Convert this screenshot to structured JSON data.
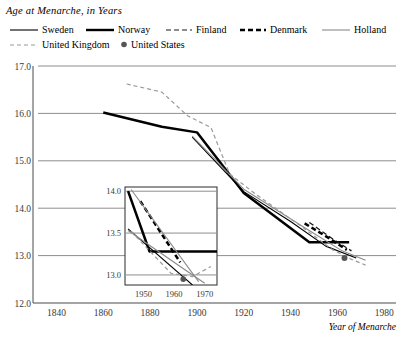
{
  "title": "Age at Menarche, in Years",
  "axis_label_x": "Year of Menarche",
  "legend": {
    "items": [
      {
        "label": "Sweden",
        "style": "thin-solid-black",
        "color": "#000000",
        "icon": "line-swatch-icon"
      },
      {
        "label": "Norway",
        "style": "thick-solid-black",
        "color": "#000000",
        "icon": "line-swatch-icon"
      },
      {
        "label": "Finland",
        "style": "thin-dashed-black",
        "color": "#1a1a1a",
        "icon": "dashed-line-swatch-icon"
      },
      {
        "label": "Denmark",
        "style": "thick-dashed-black",
        "color": "#000000",
        "icon": "dashed-line-swatch-icon"
      },
      {
        "label": "Holland",
        "style": "thin-solid-gray",
        "color": "#8a8a8a",
        "icon": "line-swatch-icon"
      },
      {
        "label": "United Kingdom",
        "style": "thin-dashed-gray",
        "color": "#9a9a9a",
        "icon": "dashed-line-swatch-icon"
      },
      {
        "label": "United States",
        "style": "dot-marker",
        "color": "#555555",
        "icon": "dot-marker-icon"
      }
    ]
  },
  "chart_data": {
    "type": "line",
    "title": "Age at Menarche, in Years",
    "xlabel": "Year of Menarche",
    "ylabel": "",
    "xlim": [
      1830,
      1985
    ],
    "ylim": [
      12.0,
      17.0
    ],
    "xticks": [
      1840,
      1860,
      1880,
      1900,
      1920,
      1940,
      1960,
      1980
    ],
    "yticks": [
      "17.0",
      "16.0",
      "15.0",
      "14.0",
      "13.0",
      "12.0"
    ],
    "grid": "horizontal",
    "legend_position": "top",
    "series": [
      {
        "name": "Norway",
        "style": "thick-solid-black",
        "color": "#000000",
        "points": [
          [
            1860,
            16.02
          ],
          [
            1885,
            15.72
          ],
          [
            1900,
            15.6
          ],
          [
            1920,
            14.32
          ],
          [
            1948,
            13.28
          ],
          [
            1965,
            13.28
          ]
        ]
      },
      {
        "name": "Sweden",
        "style": "thin-solid-black",
        "color": "#000000",
        "points": [
          [
            1898,
            15.5
          ],
          [
            1920,
            14.35
          ],
          [
            1940,
            13.72
          ],
          [
            1955,
            13.2
          ],
          [
            1968,
            12.95
          ]
        ]
      },
      {
        "name": "Holland",
        "style": "thin-solid-gray",
        "color": "#8a8a8a",
        "points": [
          [
            1898,
            15.52
          ],
          [
            1920,
            14.4
          ],
          [
            1945,
            13.62
          ],
          [
            1962,
            13.1
          ],
          [
            1972,
            12.9
          ]
        ]
      },
      {
        "name": "United Kingdom",
        "style": "thin-dashed-gray",
        "color": "#9a9a9a",
        "points": [
          [
            1870,
            16.62
          ],
          [
            1885,
            16.45
          ],
          [
            1896,
            15.95
          ],
          [
            1906,
            15.7
          ],
          [
            1914,
            14.72
          ],
          [
            1925,
            14.3
          ],
          [
            1945,
            13.6
          ],
          [
            1958,
            13.12
          ],
          [
            1966,
            12.92
          ],
          [
            1972,
            12.8
          ]
        ]
      },
      {
        "name": "Finland",
        "style": "thin-dashed-black",
        "color": "#1a1a1a",
        "points": [
          [
            1948,
            13.7
          ],
          [
            1958,
            13.35
          ],
          [
            1966,
            13.1
          ]
        ]
      },
      {
        "name": "Denmark",
        "style": "thick-dashed-black",
        "color": "#000000",
        "points": [
          [
            1946,
            13.68
          ],
          [
            1956,
            13.38
          ],
          [
            1964,
            13.12
          ]
        ]
      },
      {
        "name": "United States",
        "style": "dot-marker",
        "color": "#555555",
        "points": [
          [
            1963,
            12.95
          ]
        ]
      }
    ],
    "inset": {
      "xlim": [
        1944,
        1974
      ],
      "ylim": [
        12.88,
        14.05
      ],
      "xticks": [
        1950,
        1960,
        1970
      ],
      "yticks": [
        "14.0",
        "13.5",
        "13.0"
      ],
      "grid": "horizontal",
      "series": [
        {
          "name": "Norway",
          "style": "thick-solid-black",
          "color": "#000000",
          "points": [
            [
              1945,
              14.0
            ],
            [
              1952,
              13.28
            ],
            [
              1974,
              13.28
            ]
          ]
        },
        {
          "name": "Sweden",
          "style": "thin-solid-black",
          "color": "#000000",
          "points": [
            [
              1945,
              13.55
            ],
            [
              1966,
              12.88
            ]
          ]
        },
        {
          "name": "Holland",
          "style": "thin-solid-gray",
          "color": "#8a8a8a",
          "points": [
            [
              1945,
              13.53
            ],
            [
              1962,
              13.1
            ],
            [
              1970,
              12.9
            ]
          ]
        },
        {
          "name": "Denmark",
          "style": "thick-dashed-black",
          "color": "#000000",
          "points": [
            [
              1949,
              13.88
            ],
            [
              1962,
              13.15
            ]
          ]
        },
        {
          "name": "Finland",
          "style": "thin-solid-gray",
          "color": "#8a8a8a",
          "points": [
            [
              1946,
              14.02
            ],
            [
              1968,
              12.92
            ]
          ]
        },
        {
          "name": "United Kingdom",
          "style": "thin-dashed-gray",
          "color": "#9a9a9a",
          "points": [
            [
              1946,
              13.52
            ],
            [
              1953,
              13.25
            ],
            [
              1959,
              13.02
            ],
            [
              1966,
              12.98
            ],
            [
              1972,
              13.1
            ]
          ]
        },
        {
          "name": "United States",
          "style": "dot-marker",
          "color": "#555555",
          "points": [
            [
              1963,
              12.95
            ]
          ]
        }
      ]
    }
  }
}
